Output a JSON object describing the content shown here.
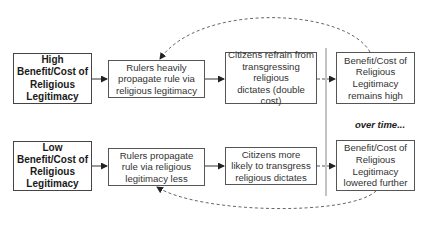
{
  "diagram": {
    "top_row": {
      "start": {
        "lines": [
          "High",
          "Benefit/Cost of",
          "Religious",
          "Legitimacy"
        ]
      },
      "rulers": {
        "lines": [
          "Rulers heavily",
          "propagate rule via",
          "religious legitimacy"
        ]
      },
      "citizens": {
        "lines": [
          "Citizens refrain from",
          "transgressing",
          "religious",
          "dictates (double cost)"
        ]
      },
      "outcome": {
        "lines": [
          "Benefit/Cost of",
          "Religious",
          "Legitimacy",
          "remains high"
        ]
      }
    },
    "bottom_row": {
      "start": {
        "lines": [
          "Low",
          "Benefit/Cost of",
          "Religious",
          "Legitimacy"
        ]
      },
      "rulers": {
        "lines": [
          "Rulers propagate",
          "rule via religious",
          "legitimacy less"
        ]
      },
      "citizens": {
        "lines": [
          "Citizens more",
          "likely to transgress",
          "religious dictates"
        ]
      },
      "outcome": {
        "lines": [
          "Benefit/Cost of",
          "Religious",
          "Legitimacy",
          "lowered further"
        ]
      }
    },
    "separator_label": "over time...",
    "colors": {
      "box_border": "#555555",
      "text": "#333333",
      "arrow": "#222222",
      "dashed": "#666666",
      "separator": "#888888"
    },
    "connections": [
      {
        "from": "top_row.start",
        "to": "top_row.rulers",
        "style": "solid"
      },
      {
        "from": "top_row.rulers",
        "to": "top_row.citizens",
        "style": "solid"
      },
      {
        "from": "top_row.citizens",
        "to": "top_row.outcome",
        "style": "dashed"
      },
      {
        "from": "top_row.outcome",
        "to": "top_row.rulers",
        "style": "dashed-curve-feedback"
      },
      {
        "from": "bottom_row.start",
        "to": "bottom_row.rulers",
        "style": "solid"
      },
      {
        "from": "bottom_row.rulers",
        "to": "bottom_row.citizens",
        "style": "solid"
      },
      {
        "from": "bottom_row.citizens",
        "to": "bottom_row.outcome",
        "style": "dashed"
      },
      {
        "from": "bottom_row.outcome",
        "to": "bottom_row.rulers",
        "style": "dashed-curve-feedback"
      }
    ]
  }
}
